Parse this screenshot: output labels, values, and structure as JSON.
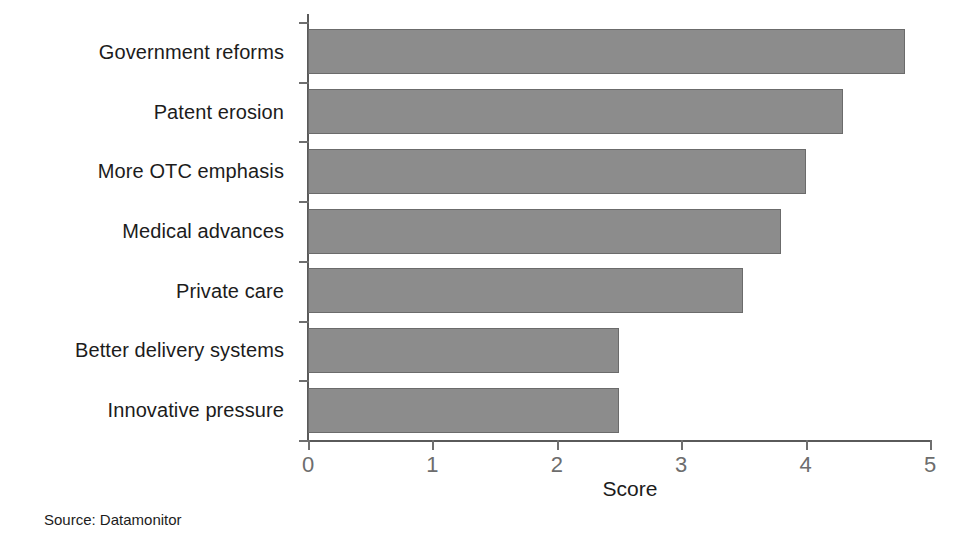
{
  "chart_data": {
    "type": "bar",
    "orientation": "horizontal",
    "title": "",
    "subtitle": "",
    "xlabel": "Score",
    "ylabel": "",
    "categories": [
      "Government reforms",
      "Patent erosion",
      "More OTC emphasis",
      "Medical advances",
      "Private care",
      "Better delivery systems",
      "Innovative pressure"
    ],
    "values": [
      4.8,
      4.3,
      4.0,
      3.8,
      3.5,
      2.5,
      2.5
    ],
    "xlim": [
      0,
      5
    ],
    "xticks": [
      0,
      1,
      2,
      3,
      4,
      5
    ],
    "xtick_labels": [
      "0",
      "1",
      "2",
      "3",
      "4",
      "5"
    ],
    "grid": false,
    "legend": null,
    "bar_color": "#8c8c8c",
    "bar_edge_color": "#6b6b6b",
    "axis_color": "#5a5a5a",
    "tick_label_color": "#6d6d6d",
    "text_color": "#1c1c1c",
    "background_color": "#ffffff"
  },
  "annotations": {
    "source_note": "Source: Datamonitor"
  }
}
